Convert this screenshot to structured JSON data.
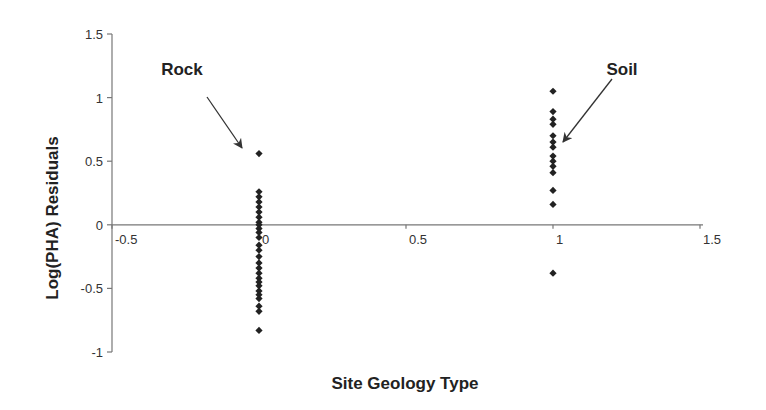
{
  "chart_data": {
    "type": "scatter",
    "title": "",
    "xlabel": "Site Geology Type",
    "ylabel": "Log(PHA) Residuals",
    "xlim": [
      -0.5,
      1.5
    ],
    "ylim": [
      -1,
      1.5
    ],
    "x_ticks": [
      -0.5,
      0,
      0.5,
      1,
      1.5
    ],
    "x_tick_labels": [
      "-0.5",
      "0",
      "0.5",
      "1",
      "1.5"
    ],
    "y_ticks": [
      -1,
      -0.5,
      0,
      0.5,
      1,
      1.5
    ],
    "y_tick_labels": [
      "-1",
      "-0.5",
      "0",
      "0.5",
      "1",
      "1.5"
    ],
    "grid": false,
    "legend": null,
    "marker": "diamond",
    "marker_color": "#222222",
    "series": [
      {
        "name": "Rock",
        "x": 0,
        "values": [
          0.56,
          0.26,
          0.22,
          0.18,
          0.14,
          0.1,
          0.06,
          0.02,
          0.0,
          -0.03,
          -0.06,
          -0.1,
          -0.16,
          -0.2,
          -0.25,
          -0.3,
          -0.34,
          -0.38,
          -0.42,
          -0.45,
          -0.48,
          -0.52,
          -0.55,
          -0.58,
          -0.64,
          -0.68,
          -0.83
        ]
      },
      {
        "name": "Soil",
        "x": 1,
        "values": [
          1.05,
          0.89,
          0.83,
          0.79,
          0.7,
          0.65,
          0.61,
          0.54,
          0.5,
          0.46,
          0.41,
          0.27,
          0.16,
          -0.38
        ]
      }
    ],
    "annotations": [
      {
        "text": "Rock",
        "arrow_to_series": "Rock"
      },
      {
        "text": "Soil",
        "arrow_to_series": "Soil"
      }
    ]
  }
}
